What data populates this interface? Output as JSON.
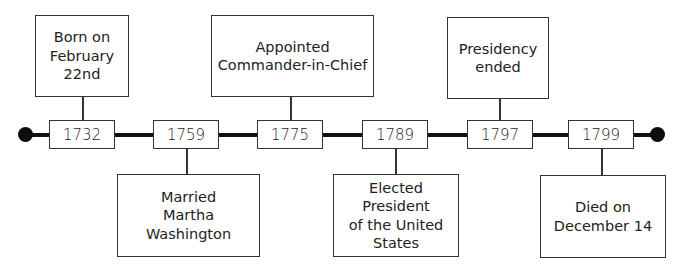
{
  "diagram": {
    "type": "timeline",
    "events": [
      {
        "year": "1732",
        "label": "Born on\nFebruary\n22nd",
        "position": "above"
      },
      {
        "year": "1759",
        "label": "Married\nMartha Washington",
        "position": "below"
      },
      {
        "year": "1775",
        "label": "Appointed\nCommander-in-Chief",
        "position": "above"
      },
      {
        "year": "1789",
        "label": "Elected President\nof the United\nStates",
        "position": "below"
      },
      {
        "year": "1797",
        "label": "Presidency\nended",
        "position": "above"
      },
      {
        "year": "1799",
        "label": "Died on\nDecember 14",
        "position": "below"
      }
    ],
    "colors": {
      "line": "#111111",
      "border": "#333333",
      "text": "#222222",
      "background": "#ffffff"
    }
  }
}
